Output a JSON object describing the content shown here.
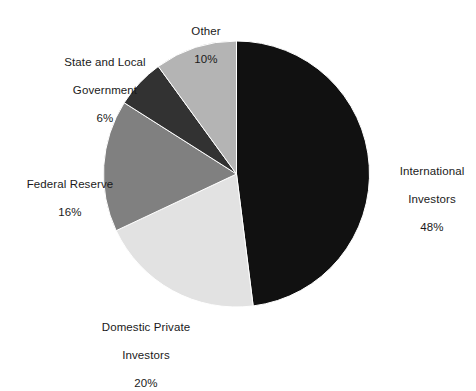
{
  "chart_data": {
    "type": "pie",
    "title": "",
    "subtitle": "",
    "xlabel": "",
    "ylabel": "",
    "legend_position": "none",
    "grid": false,
    "labels_outside": true,
    "value_suffix": "%",
    "categories": [
      "International Investors",
      "Domestic Private Investors",
      "Federal Reserve",
      "State and Local Government",
      "Other"
    ],
    "values": [
      48,
      20,
      16,
      6,
      10
    ],
    "colors": [
      "#111111",
      "#e2e2e2",
      "#808080",
      "#323232",
      "#b4b4b4"
    ],
    "start_angle_deg": 0,
    "direction": "clockwise",
    "slices": [
      {
        "name": "International Investors",
        "label_line1": "International",
        "label_line2": "Investors",
        "value": 48,
        "percent_text": "48%",
        "color": "#111111",
        "position": "right"
      },
      {
        "name": "Domestic Private Investors",
        "label_line1": "Domestic Private",
        "label_line2": "Investors",
        "value": 20,
        "percent_text": "20%",
        "color": "#e2e2e2",
        "position": "bottom-left"
      },
      {
        "name": "Federal Reserve",
        "label_line1": "Federal Reserve",
        "label_line2": "",
        "value": 16,
        "percent_text": "16%",
        "color": "#808080",
        "position": "left"
      },
      {
        "name": "State and Local Government",
        "label_line1": "State and Local",
        "label_line2": "Government",
        "value": 6,
        "percent_text": "6%",
        "color": "#323232",
        "position": "top-left"
      },
      {
        "name": "Other",
        "label_line1": "Other",
        "label_line2": "",
        "value": 10,
        "percent_text": "10%",
        "color": "#b4b4b4",
        "position": "top"
      }
    ]
  },
  "labels": {
    "other": {
      "line1": "Other",
      "pct": "10%"
    },
    "state_local": {
      "line1": "State and Local",
      "line2": "Government",
      "pct": "6%"
    },
    "federal_reserve": {
      "line1": "Federal Reserve",
      "pct": "16%"
    },
    "domestic": {
      "line1": "Domestic Private",
      "line2": "Investors",
      "pct": "20%"
    },
    "international": {
      "line1": "International",
      "line2": "Investors",
      "pct": "48%"
    }
  }
}
